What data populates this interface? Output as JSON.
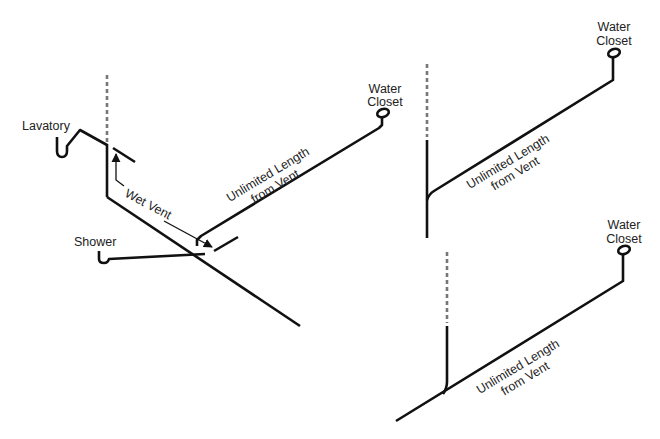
{
  "diagram": {
    "colors": {
      "pipe": "#111111",
      "vent": "#777777",
      "text": "#222222",
      "background": "#ffffff"
    },
    "left": {
      "lavatory_label": "Lavatory",
      "shower_label": "Shower",
      "wet_vent_label": "Wet Vent",
      "unlimited_line1": "Unlimited Length",
      "unlimited_line2": "from Vent",
      "wc_line1": "Water",
      "wc_line2": "Closet"
    },
    "top_right": {
      "unlimited_line1": "Unlimited Length",
      "unlimited_line2": "from Vent",
      "wc_line1": "Water",
      "wc_line2": "Closet"
    },
    "bottom_right": {
      "unlimited_line1": "Unlimited Length",
      "unlimited_line2": "from Vent",
      "wc_line1": "Water",
      "wc_line2": "Closet"
    }
  }
}
